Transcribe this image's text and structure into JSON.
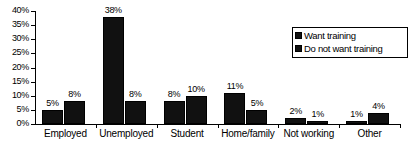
{
  "chart_data": {
    "type": "bar",
    "title": "",
    "xlabel": "",
    "ylabel": "",
    "categories": [
      "Employed",
      "Unemployed",
      "Student",
      "Home/family",
      "Not working",
      "Other"
    ],
    "series": [
      {
        "name": "Want training",
        "values": [
          5,
          38,
          8,
          11,
          2,
          1
        ],
        "color": "#111111"
      },
      {
        "name": "Do not want training",
        "values": [
          8,
          8,
          10,
          5,
          1,
          4
        ],
        "color": "#111111"
      }
    ],
    "value_labels": [
      [
        "5%",
        "38%",
        "8%",
        "11%",
        "2%",
        "1%"
      ],
      [
        "8%",
        "8%",
        "10%",
        "5%",
        "1%",
        "4%"
      ]
    ],
    "ylim": [
      0,
      40
    ],
    "ytick_values": [
      0,
      5,
      10,
      15,
      20,
      25,
      30,
      35,
      40
    ],
    "ytick_labels": [
      "0%",
      "5%",
      "10%",
      "15%",
      "20%",
      "25%",
      "30%",
      "35%",
      "40%"
    ],
    "grid": false,
    "legend_position": "top-right",
    "legend_entries": [
      "Want training",
      "Do not want training"
    ]
  }
}
